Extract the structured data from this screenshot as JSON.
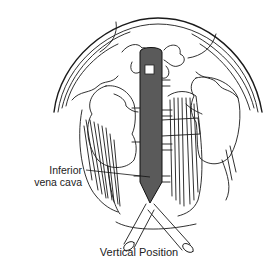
{
  "figure": {
    "caption": "Vertical Position",
    "labels": {
      "inferior_vena_cava_line1": "Inferior",
      "inferior_vena_cava_line2": "vena cava"
    },
    "colors": {
      "vena_cava_fill": "#5a5a5a",
      "line": "#1a1a1a",
      "background": "#ffffff"
    },
    "structures": [
      "diaphragm",
      "inferior-vena-cava",
      "left-kidney",
      "right-kidney",
      "psoas-muscles",
      "vertebrae",
      "common-iliac-veins",
      "renal-veins"
    ]
  }
}
